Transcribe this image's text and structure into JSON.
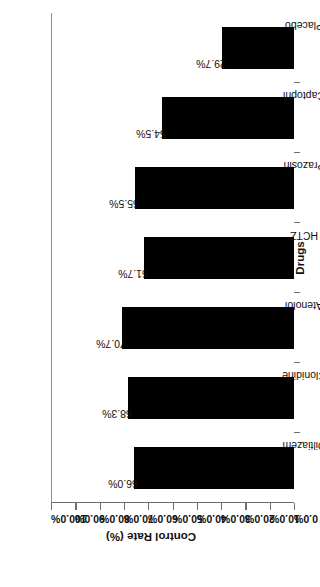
{
  "chart_data": {
    "type": "bar",
    "orientation": "vertical",
    "title": "",
    "xlabel": "Drugs",
    "ylabel": "Control Rate (%)",
    "categories": [
      "Diltiazem",
      "Clonidine",
      "Atenolol",
      "HCTZ",
      "Prazosin",
      "Captopril",
      "Placebo"
    ],
    "values": [
      66.0,
      68.3,
      70.7,
      61.7,
      65.5,
      54.5,
      29.7
    ],
    "data_labels": [
      "66.0%",
      "68.3%",
      "70.7%",
      "61.7%",
      "65.5%",
      "54.5%",
      "29.7%"
    ],
    "ylim": [
      0,
      100
    ],
    "ytick_values": [
      0,
      10,
      20,
      30,
      40,
      50,
      60,
      70,
      80,
      90,
      100
    ],
    "ytick_labels": [
      "0.0%",
      "10.0%",
      "20.0%",
      "30.0%",
      "40.0%",
      "50.0%",
      "60.0%",
      "70.0%",
      "80.0%",
      "90.0%",
      "100.0%"
    ],
    "grid": false,
    "legend": false,
    "bar_color": "#000000",
    "axis_color": "#6e6e6e",
    "background_color": "#ffffff",
    "page_rotation_degrees": -90
  }
}
